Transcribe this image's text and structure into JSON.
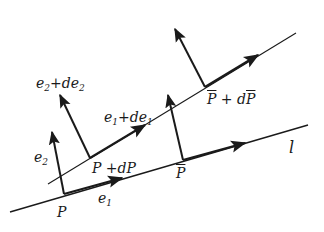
{
  "diagram": {
    "colors": {
      "stroke": "#1a1a1a",
      "background": "#ffffff"
    },
    "lines": {
      "l": {
        "label": "l",
        "from": [
          10,
          212
        ],
        "to": [
          308,
          125
        ]
      },
      "upper": {
        "from": [
          48,
          184
        ],
        "to": [
          296,
          33
        ]
      }
    },
    "points": {
      "P": {
        "label": "P",
        "pos": [
          64,
          194
        ]
      },
      "P_dP": {
        "label": "P +dP",
        "pos": [
          90,
          158
        ]
      },
      "Pbar": {
        "label": "P",
        "pos": [
          183,
          160
        ]
      },
      "Pbar_dPbar": {
        "label": "P + dP",
        "pos": [
          205,
          87
        ]
      }
    },
    "vectors": {
      "e1": {
        "label": "e",
        "sub": "1",
        "from": [
          64,
          194
        ],
        "to": [
          122,
          178
        ]
      },
      "e2": {
        "label": "e",
        "sub": "2",
        "from": [
          64,
          194
        ],
        "to": [
          52,
          132
        ]
      },
      "e1_de1": {
        "label_a": "e",
        "sub_a": "1",
        "label_b": "+de",
        "sub_b": "1",
        "from": [
          90,
          158
        ],
        "to": [
          145,
          125
        ]
      },
      "e2_de2": {
        "label_a": "e",
        "sub_a": "2",
        "label_b": "+de",
        "sub_b": "2",
        "from": [
          90,
          158
        ],
        "to": [
          60,
          95
        ]
      },
      "e1_bar": {
        "from": [
          183,
          160
        ],
        "to": [
          245,
          143
        ]
      },
      "e2_bar": {
        "from": [
          183,
          160
        ],
        "to": [
          168,
          95
        ]
      },
      "e1_bar_d": {
        "from": [
          205,
          87
        ],
        "to": [
          258,
          55
        ]
      },
      "e2_bar_d": {
        "from": [
          205,
          87
        ],
        "to": [
          175,
          29
        ]
      }
    }
  }
}
